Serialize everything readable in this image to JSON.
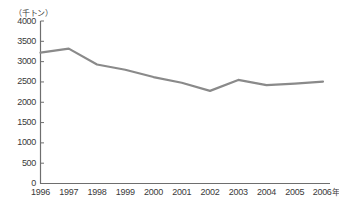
{
  "unit_label": "（千トン）",
  "axis": {
    "y_ticks": [
      "4000",
      "3500",
      "3000",
      "2500",
      "2000",
      "1500",
      "1000",
      "500",
      "0"
    ],
    "x_ticks": [
      "1996",
      "1997",
      "1998",
      "1999",
      "2000",
      "2001",
      "2002",
      "2003",
      "2004",
      "2005",
      "2006"
    ],
    "x_axis_suffix": "年"
  },
  "colors": {
    "line": "#8a8a8a",
    "axis": "#6e6e6e",
    "text": "#3a3a3a",
    "background": "#ffffff"
  },
  "chart_data": {
    "type": "line",
    "title": "",
    "subtitle": "",
    "xlabel": "年",
    "ylabel": "千トン",
    "categories": [
      "1996",
      "1997",
      "1998",
      "1999",
      "2000",
      "2001",
      "2002",
      "2003",
      "2004",
      "2005",
      "2006"
    ],
    "values": [
      3220,
      3320,
      2930,
      2800,
      2620,
      2480,
      2280,
      2550,
      2420,
      2460,
      2510
    ],
    "series": [
      {
        "name": "",
        "values": [
          3220,
          3320,
          2930,
          2800,
          2620,
          2480,
          2280,
          2550,
          2420,
          2460,
          2510
        ]
      }
    ],
    "ylim": [
      0,
      4000
    ],
    "ytick_step": 500,
    "grid": false,
    "legend": false,
    "legend_position": "none"
  }
}
